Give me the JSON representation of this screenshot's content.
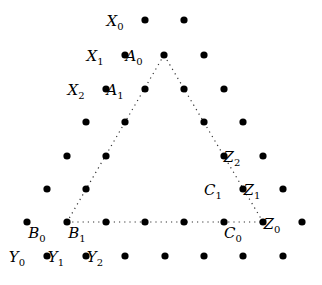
{
  "diagram": {
    "dots": [
      [
        145,
        20
      ],
      [
        184,
        20
      ],
      [
        125,
        55
      ],
      [
        164,
        55
      ],
      [
        204,
        55
      ],
      [
        106,
        89
      ],
      [
        145,
        89
      ],
      [
        184,
        89
      ],
      [
        224,
        89
      ],
      [
        86,
        122
      ],
      [
        125,
        122
      ],
      [
        204,
        122
      ],
      [
        243,
        122
      ],
      [
        67,
        156
      ],
      [
        106,
        156
      ],
      [
        224,
        156
      ],
      [
        263,
        156
      ],
      [
        47,
        189
      ],
      [
        86,
        189
      ],
      [
        243,
        189
      ],
      [
        283,
        189
      ],
      [
        27,
        222
      ],
      [
        67,
        222
      ],
      [
        106,
        222
      ],
      [
        145,
        222
      ],
      [
        184,
        222
      ],
      [
        224,
        222
      ],
      [
        263,
        222
      ],
      [
        302,
        222
      ],
      [
        47,
        256
      ],
      [
        86,
        256
      ],
      [
        125,
        256
      ],
      [
        165,
        256
      ],
      [
        204,
        256
      ],
      [
        243,
        256
      ],
      [
        283,
        256
      ]
    ],
    "triangle": {
      "vertices": [
        [
          164,
          55
        ],
        [
          67,
          222
        ],
        [
          263,
          222
        ]
      ],
      "style": "dotted"
    },
    "labels": [
      {
        "base": "X",
        "sub": "0",
        "x": 115,
        "y": 26
      },
      {
        "base": "X",
        "sub": "1",
        "x": 95,
        "y": 61
      },
      {
        "base": "A",
        "sub": "0",
        "x": 134,
        "y": 61
      },
      {
        "base": "X",
        "sub": "2",
        "x": 76,
        "y": 95
      },
      {
        "base": "A",
        "sub": "1",
        "x": 115,
        "y": 95
      },
      {
        "base": "Z",
        "sub": "2",
        "x": 232,
        "y": 162
      },
      {
        "base": "C",
        "sub": "1",
        "x": 213,
        "y": 195
      },
      {
        "base": "Z",
        "sub": "1",
        "x": 252,
        "y": 195
      },
      {
        "base": "B",
        "sub": "0",
        "x": 37,
        "y": 238
      },
      {
        "base": "B",
        "sub": "1",
        "x": 77,
        "y": 238
      },
      {
        "base": "C",
        "sub": "0",
        "x": 233,
        "y": 238
      },
      {
        "base": "Z",
        "sub": "0",
        "x": 272,
        "y": 229
      },
      {
        "base": "Y",
        "sub": "0",
        "x": 17,
        "y": 262
      },
      {
        "base": "Y",
        "sub": "1",
        "x": 56,
        "y": 262
      },
      {
        "base": "Y",
        "sub": "2",
        "x": 95,
        "y": 262
      }
    ]
  }
}
